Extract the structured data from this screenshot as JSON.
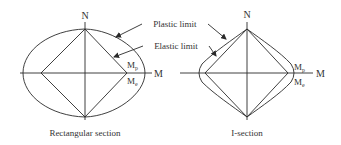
{
  "figure": {
    "stroke_color": "#2a2a2a",
    "background": "#ffffff",
    "annotations": {
      "plastic_limit": "Plastic limit",
      "elastic_limit": "Elastic limit"
    },
    "left_diagram": {
      "caption": "Rectangular section",
      "axis_n": "N",
      "axis_m": "M",
      "mp_main": "M",
      "mp_sub": "p",
      "me_main": "M",
      "me_sub": "e",
      "plastic_shape": "ellipse",
      "elastic_shape": "diamond"
    },
    "right_diagram": {
      "caption": "I-section",
      "axis_n": "N",
      "axis_m": "M",
      "mp_main": "M",
      "mp_sub": "p",
      "me_main": "M",
      "me_sub": "e",
      "plastic_shape": "convex-diamond",
      "elastic_shape": "diamond"
    }
  }
}
